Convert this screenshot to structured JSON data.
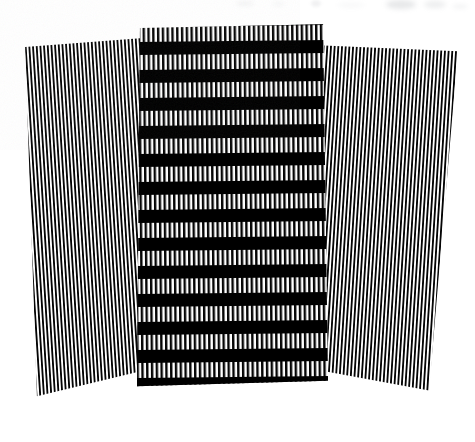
{
  "figure": {
    "medium": "halftone line grating, black ink on white paper",
    "canvas": {
      "width": 475,
      "height": 442,
      "background": "#ffffff"
    },
    "colors": {
      "ink": "#050505",
      "paper": "#ffffff",
      "band_ink": "#000000",
      "smudge": "#b9bcc0"
    },
    "grating": {
      "pitch_px": 4.4,
      "duty_cycle": 0.5,
      "profile": "square-wave"
    },
    "panels": [
      {
        "id": "panel-left",
        "name": "left-panel",
        "label": "Left grating panel",
        "stripe_orientation": "vertical",
        "tilt_degrees": -3.6,
        "stripe_pitch_px": 4.4,
        "has_horizontal_bands": false,
        "bounds": {
          "x": 2,
          "y": 38,
          "width": 152,
          "height": 375
        }
      },
      {
        "id": "panel-center",
        "name": "center-panel",
        "label": "Central banded grating panel",
        "stripe_orientation": "vertical",
        "tilt_degrees": -0.6,
        "stripe_pitch_px": 4.4,
        "has_horizontal_bands": true,
        "band_period_px": 28,
        "band_thickness_px": 13,
        "band_count": 13,
        "bounds": {
          "x": 134,
          "y": 22,
          "width": 198,
          "height": 368
        }
      },
      {
        "id": "panel-right",
        "name": "right-panel",
        "label": "Right grating panel",
        "stripe_orientation": "vertical",
        "tilt_degrees": 3.6,
        "stripe_pitch_px": 4.4,
        "has_horizontal_bands": false,
        "bounds": {
          "x": 318,
          "y": 38,
          "width": 152,
          "height": 375
        }
      }
    ],
    "artifacts": [
      {
        "name": "scan-smudge-1",
        "x": 236,
        "y": 1,
        "width": 18,
        "height": 5,
        "opacity": 0.16,
        "blur": 2.2
      },
      {
        "name": "scan-smudge-2",
        "x": 272,
        "y": 2,
        "width": 13,
        "height": 4,
        "opacity": 0.12,
        "blur": 2.0
      },
      {
        "name": "scan-smudge-3",
        "x": 311,
        "y": 0,
        "width": 10,
        "height": 7,
        "opacity": 0.2,
        "blur": 1.8
      },
      {
        "name": "scan-smudge-4",
        "x": 338,
        "y": 3,
        "width": 26,
        "height": 4,
        "opacity": 0.13,
        "blur": 2.4
      },
      {
        "name": "scan-smudge-5",
        "x": 386,
        "y": 0,
        "width": 30,
        "height": 9,
        "opacity": 0.34,
        "blur": 2.6
      },
      {
        "name": "scan-smudge-6",
        "x": 424,
        "y": 1,
        "width": 22,
        "height": 7,
        "opacity": 0.26,
        "blur": 2.4
      },
      {
        "name": "scan-smudge-7",
        "x": 452,
        "y": 4,
        "width": 16,
        "height": 5,
        "opacity": 0.15,
        "blur": 2.2
      }
    ]
  }
}
